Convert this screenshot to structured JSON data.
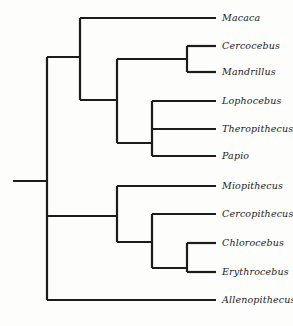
{
  "figure": {
    "kind": "cladogram",
    "ink_color": "#1c1c1c",
    "background_color": "#fdfdfb",
    "line_width": 2.2,
    "tip_x": 216,
    "label_x": 222,
    "root_stem_x": 13,
    "root_x": 47
  },
  "taxa": [
    {
      "id": "macaca",
      "label": "Macaca",
      "y": 18,
      "branch_from_x": 80
    },
    {
      "id": "cercocebus",
      "label": "Cercocebus",
      "y": 46,
      "branch_from_x": 187
    },
    {
      "id": "mandrillus",
      "label": "Mandrillus",
      "y": 72,
      "branch_from_x": 187
    },
    {
      "id": "lophocebus",
      "label": "Lophocebus",
      "y": 101,
      "branch_from_x": 152
    },
    {
      "id": "theropithecus",
      "label": "Theropithecus",
      "y": 129,
      "branch_from_x": 152
    },
    {
      "id": "papio",
      "label": "Papio",
      "y": 156,
      "branch_from_x": 152
    },
    {
      "id": "miopithecus",
      "label": "Miopithecus",
      "y": 186,
      "branch_from_x": 117
    },
    {
      "id": "cercopithecus",
      "label": "Cercopithecus",
      "y": 214,
      "branch_from_x": 152
    },
    {
      "id": "chlorocebus",
      "label": "Chlorocebus",
      "y": 243,
      "branch_from_x": 187
    },
    {
      "id": "erythrocebus",
      "label": "Erythrocebus",
      "y": 272,
      "branch_from_x": 187
    },
    {
      "id": "allenopithecus",
      "label": "Allenopithecus",
      "y": 300,
      "branch_from_x": 47
    }
  ],
  "internal_nodes": [
    {
      "id": "root",
      "x": 47,
      "y_top": 57,
      "y_bottom": 300,
      "stem_y": 181,
      "stem_from_x": 13
    },
    {
      "id": "papionini",
      "x": 80,
      "y_top": 18,
      "y_bottom": 100,
      "stem_y": 57,
      "stem_from_x": 47
    },
    {
      "id": "papionina",
      "x": 117,
      "y_top": 59,
      "y_bottom": 143,
      "stem_y": 100,
      "stem_from_x": 80
    },
    {
      "id": "cercocebus-clade",
      "x": 187,
      "y_top": 46,
      "y_bottom": 72,
      "stem_y": 59,
      "stem_from_x": 117
    },
    {
      "id": "papio-clade",
      "x": 152,
      "y_top": 101,
      "y_bottom": 156,
      "stem_y": 143,
      "stem_from_x": 117
    },
    {
      "id": "cercopithecini",
      "x": 117,
      "y_top": 186,
      "y_bottom": 242,
      "stem_y": 216,
      "stem_from_x": 47
    },
    {
      "id": "cercopithecus-clade",
      "x": 152,
      "y_top": 214,
      "y_bottom": 268,
      "stem_y": 242,
      "stem_from_x": 117
    },
    {
      "id": "chlorocebus-clade",
      "x": 187,
      "y_top": 243,
      "y_bottom": 272,
      "stem_y": 268,
      "stem_from_x": 152
    }
  ]
}
